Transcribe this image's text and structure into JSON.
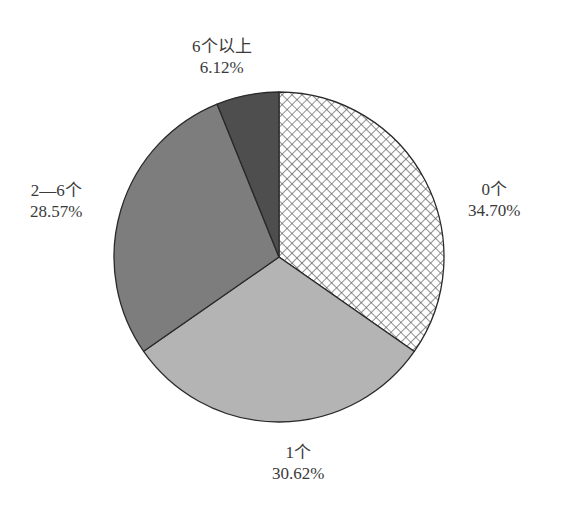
{
  "chart_data": {
    "type": "pie",
    "title": "",
    "categories": [
      "0个",
      "1个",
      "2—6个",
      "6个以上"
    ],
    "values": [
      34.7,
      30.62,
      28.57,
      6.12
    ],
    "value_labels": [
      "34.70%",
      "30.62%",
      "28.57%",
      "6.12%"
    ],
    "start_angle_deg": 90,
    "direction": "clockwise",
    "legend": "none",
    "fills": [
      "crosshatch",
      "#b4b4b4",
      "#7d7d7d",
      "#4e4e4e"
    ]
  },
  "labels": [
    {
      "name": "0个",
      "pct": "34.70%"
    },
    {
      "name": "1个",
      "pct": "30.62%"
    },
    {
      "name": "2—6个",
      "pct": "28.57%"
    },
    {
      "name": "6个以上",
      "pct": "6.12%"
    }
  ],
  "colors": {
    "outline": "#2a2a2a",
    "hatch_line": "#555555",
    "slice_1": "#b4b4b4",
    "slice_2": "#7d7d7d",
    "slice_3": "#4e4e4e"
  }
}
